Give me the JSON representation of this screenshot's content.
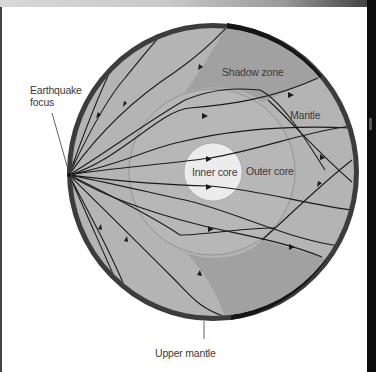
{
  "figure": {
    "labels": {
      "earthquake_focus_line1": "Earthquake",
      "earthquake_focus_line2": "focus",
      "shadow_zone": "Shadow zone",
      "mantle": "Mantle",
      "inner_core": "Inner core",
      "outer_core": "Outer core",
      "upper_mantle": "Upper mantle"
    },
    "colors": {
      "crust": "#3c3c3c",
      "crust_shadow": "#161616",
      "mantle": "#b4b4b4",
      "shadow_zone": "#a1a1a1",
      "outer_core": "#b7b7b7",
      "inner_core": "#ececec",
      "ray": "#1a1a1a",
      "core_outline": "#8a8a8a"
    },
    "geometry": {
      "earth_center": [
        213,
        172
      ],
      "earth_radius": 147,
      "outer_core_radius": 83,
      "inner_core_radius": 29,
      "focus": [
        69,
        175
      ]
    }
  }
}
